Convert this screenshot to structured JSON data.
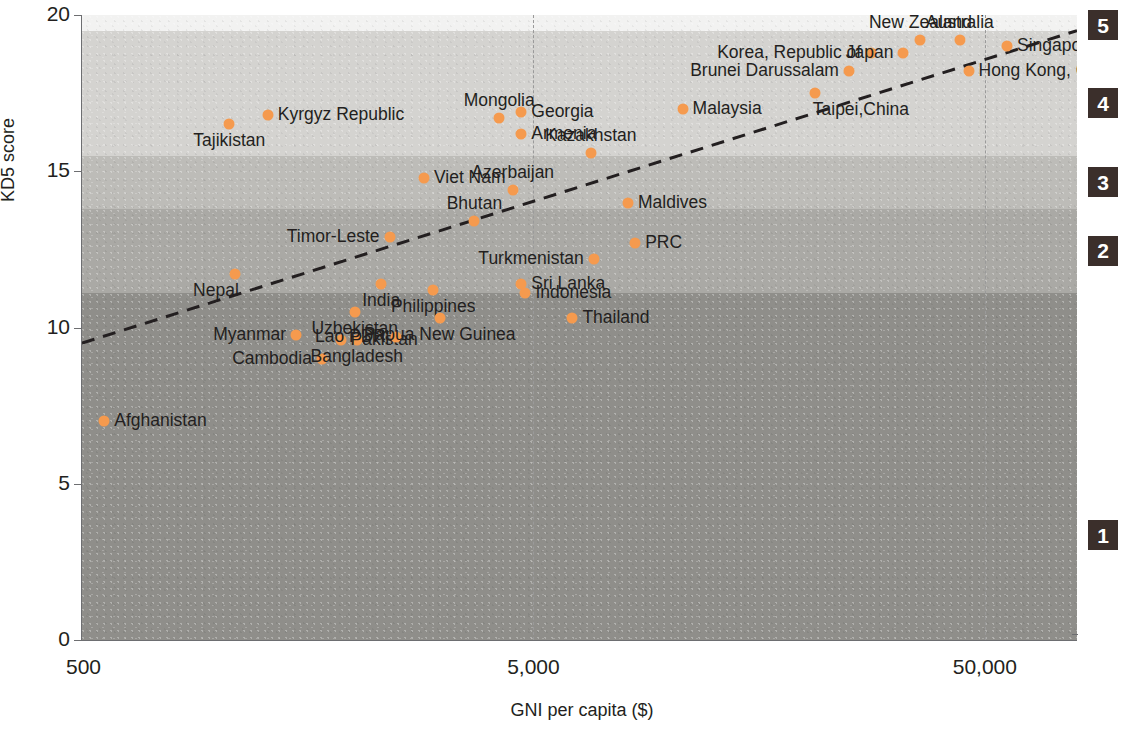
{
  "chart_data": {
    "type": "scatter",
    "title": "",
    "xlabel": "GNI per capita ($)",
    "ylabel": "KD5 score",
    "xscale": "log",
    "xlim": [
      500,
      80000
    ],
    "ylim": [
      0,
      20
    ],
    "xticks": [
      {
        "label": "500",
        "value": 500
      },
      {
        "label": "5,000",
        "value": 5000
      },
      {
        "label": "50,000",
        "value": 50000
      }
    ],
    "yticks": [
      {
        "label": "0",
        "value": 0
      },
      {
        "label": "5",
        "value": 5
      },
      {
        "label": "10",
        "value": 10
      },
      {
        "label": "15",
        "value": 15
      },
      {
        "label": "20",
        "value": 20
      }
    ],
    "grid": "vertical-dashed",
    "legend": "none",
    "point_color": "#f59a4e",
    "trendline": {
      "style": "dashed",
      "color": "#231f20",
      "x_start": 500,
      "y_start": 9.5,
      "x_end": 80000,
      "y_end": 19.5
    },
    "bands": [
      {
        "label": "5",
        "y_min": 19.5,
        "y_max": 20.0,
        "color": "#f2f2f1"
      },
      {
        "label": "4",
        "y_min": 15.5,
        "y_max": 19.5,
        "color": "#d4d3d0"
      },
      {
        "label": "3",
        "y_min": 13.8,
        "y_max": 15.5,
        "color": "#bdbcb8"
      },
      {
        "label": "2",
        "y_min": 11.1,
        "y_max": 13.8,
        "color": "#aaa9a5"
      },
      {
        "label": "1",
        "y_min": 0.0,
        "y_max": 11.1,
        "color": "#8f8e8a"
      }
    ],
    "points": [
      {
        "name": "Afghanistan",
        "gni": 560,
        "kd5": 7.0,
        "label_side": "right"
      },
      {
        "name": "Tajikistan",
        "gni": 1060,
        "kd5": 16.5,
        "label_side": "below-center"
      },
      {
        "name": "Kyrgyz Republic",
        "gni": 1290,
        "kd5": 16.8,
        "label_side": "right"
      },
      {
        "name": "Nepal",
        "gni": 1090,
        "kd5": 11.7,
        "label_side": "below-left"
      },
      {
        "name": "Myanmar",
        "gni": 1490,
        "kd5": 9.75,
        "label_side": "left"
      },
      {
        "name": "Cambodia",
        "gni": 1700,
        "kd5": 9.0,
        "label_side": "left"
      },
      {
        "name": "Uzbekistan",
        "gni": 2010,
        "kd5": 10.5,
        "label_side": "below-center"
      },
      {
        "name": "Bangladesh",
        "gni": 2030,
        "kd5": 9.6,
        "label_side": "below-center"
      },
      {
        "name": "Pakistan",
        "gni": 1870,
        "kd5": 9.6,
        "label_side": "right"
      },
      {
        "name": "Timor-Leste",
        "gni": 2400,
        "kd5": 12.9,
        "label_side": "left"
      },
      {
        "name": "India",
        "gni": 2300,
        "kd5": 11.4,
        "label_side": "below-center"
      },
      {
        "name": "Lao PDR",
        "gni": 2480,
        "kd5": 9.7,
        "label_side": "left"
      },
      {
        "name": "Viet Nam",
        "gni": 2860,
        "kd5": 14.8,
        "label_side": "right"
      },
      {
        "name": "Philippines",
        "gni": 3000,
        "kd5": 11.2,
        "label_side": "below-center"
      },
      {
        "name": "Papua New Guinea",
        "gni": 3100,
        "kd5": 10.3,
        "label_side": "below-center"
      },
      {
        "name": "Bhutan",
        "gni": 3700,
        "kd5": 13.4,
        "label_side": "above-center"
      },
      {
        "name": "Mongolia",
        "gni": 4200,
        "kd5": 16.7,
        "label_side": "above-center"
      },
      {
        "name": "Georgia",
        "gni": 4700,
        "kd5": 16.9,
        "label_side": "right"
      },
      {
        "name": "Armenia",
        "gni": 4700,
        "kd5": 16.2,
        "label_side": "right"
      },
      {
        "name": "Azerbaijan",
        "gni": 4500,
        "kd5": 14.4,
        "label_side": "above-center"
      },
      {
        "name": "Sri Lanka",
        "gni": 4700,
        "kd5": 11.4,
        "label_side": "right"
      },
      {
        "name": "Indonesia",
        "gni": 4800,
        "kd5": 11.1,
        "label_side": "right"
      },
      {
        "name": "Kazakhstan",
        "gni": 6700,
        "kd5": 15.6,
        "label_side": "above-center"
      },
      {
        "name": "Turkmenistan",
        "gni": 6800,
        "kd5": 12.2,
        "label_side": "left"
      },
      {
        "name": "Thailand",
        "gni": 6100,
        "kd5": 10.3,
        "label_side": "right"
      },
      {
        "name": "Maldives",
        "gni": 8100,
        "kd5": 14.0,
        "label_side": "right"
      },
      {
        "name": "PRC",
        "gni": 8400,
        "kd5": 12.7,
        "label_side": "right"
      },
      {
        "name": "Malaysia",
        "gni": 10700,
        "kd5": 17.0,
        "label_side": "right"
      },
      {
        "name": "Brunei Darussalam",
        "gni": 25000,
        "kd5": 18.2,
        "label_side": "left"
      },
      {
        "name": "Taipei,China",
        "gni": 21000,
        "kd5": 17.5,
        "label_side": "below-right"
      },
      {
        "name": "Korea, Republic of",
        "gni": 28000,
        "kd5": 18.8,
        "label_side": "left"
      },
      {
        "name": "Japan",
        "gni": 33000,
        "kd5": 18.8,
        "label_side": "left"
      },
      {
        "name": "New Zealand",
        "gni": 36000,
        "kd5": 19.2,
        "label_side": "above-center"
      },
      {
        "name": "Australia",
        "gni": 44000,
        "kd5": 19.2,
        "label_side": "above-center"
      },
      {
        "name": "Hong Kong, China",
        "gni": 46000,
        "kd5": 18.2,
        "label_side": "right"
      },
      {
        "name": "Singapore",
        "gni": 56000,
        "kd5": 19.0,
        "label_side": "right"
      }
    ]
  }
}
